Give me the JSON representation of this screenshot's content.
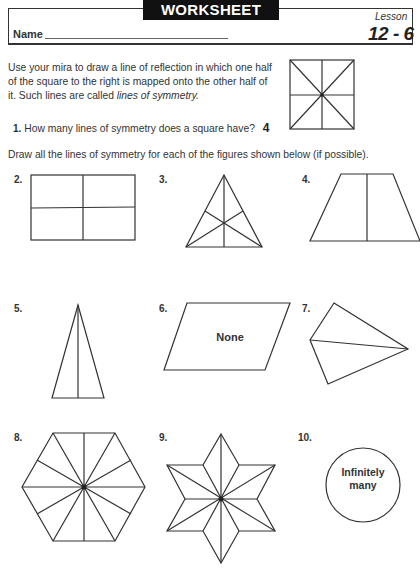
{
  "header": {
    "title": "WORKSHEET",
    "name_label": "Name",
    "lesson_label": "Lesson",
    "lesson_number": "12 - 6"
  },
  "intro": {
    "text_prefix": "Use your mira to draw a line of reflection in which one half of the square to the right is mapped onto the other half of it. Such lines are called ",
    "text_emphasis": "lines of symmetry."
  },
  "question1": {
    "number": "1.",
    "text": "How many lines of symmetry does a square have?",
    "answer": "4"
  },
  "instructions": "Draw all the lines of symmetry for each of the figures shown below (if possible).",
  "problems": [
    {
      "number": "2.",
      "shape": "rectangle",
      "lines_of_symmetry": 2
    },
    {
      "number": "3.",
      "shape": "equilateral-triangle",
      "lines_of_symmetry": 3
    },
    {
      "number": "4.",
      "shape": "isosceles-trapezoid",
      "lines_of_symmetry": 1
    },
    {
      "number": "5.",
      "shape": "isosceles-triangle",
      "lines_of_symmetry": 1
    },
    {
      "number": "6.",
      "shape": "parallelogram",
      "lines_of_symmetry": 0,
      "answer_text": "None"
    },
    {
      "number": "7.",
      "shape": "kite",
      "lines_of_symmetry": 1
    },
    {
      "number": "8.",
      "shape": "regular-hexagon",
      "lines_of_symmetry": 6
    },
    {
      "number": "9.",
      "shape": "six-pointed-star",
      "lines_of_symmetry": 6
    },
    {
      "number": "10.",
      "shape": "circle",
      "answer_text_line1": "Infinitely",
      "answer_text_line2": "many"
    }
  ]
}
